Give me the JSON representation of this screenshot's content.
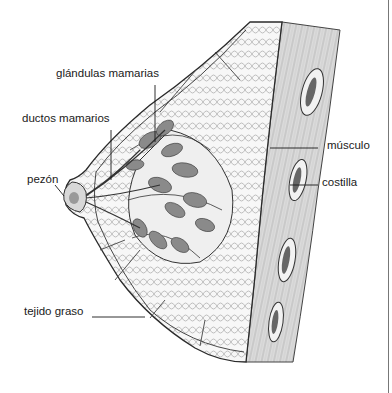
{
  "diagram": {
    "labels": [
      {
        "id": "glandulas",
        "text": "glándulas mamarias",
        "x": 56,
        "y": 68
      },
      {
        "id": "ductos",
        "text": "ductos mamarios",
        "x": 22,
        "y": 113
      },
      {
        "id": "pezon",
        "text": "pezón",
        "x": 27,
        "y": 174
      },
      {
        "id": "musculo",
        "text": "músculo",
        "x": 327,
        "y": 140
      },
      {
        "id": "costilla",
        "text": "costilla",
        "x": 322,
        "y": 177
      },
      {
        "id": "tejido",
        "text": "tejido graso",
        "x": 24,
        "y": 306
      }
    ],
    "colors": {
      "line": "#2a2a2a",
      "fat_fill": "#f4f4f4",
      "gland_fill": "#8a8a8a",
      "muscle_fill": "#d6d6d6",
      "rib_fill": "#efefef",
      "rib_core": "#6a6a6a"
    }
  }
}
